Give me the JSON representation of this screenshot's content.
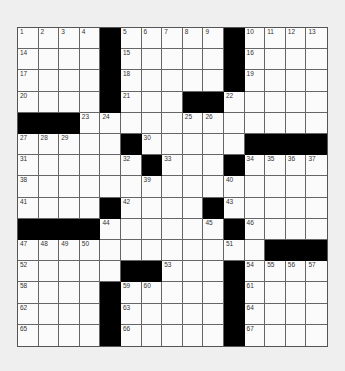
{
  "puzzle": {
    "rows": 15,
    "cols": 15,
    "colors": {
      "page_background": "#efefef",
      "cell_white": "#fbfbfb",
      "cell_black": "#000000",
      "grid_line": "#666666",
      "number_text": "#333333"
    },
    "grid": [
      ".....#.....#....",
      "x"
    ],
    "layout": [
      "1234#56789#ABCD",
      "....#.....#....",
      "....#.....#....",
      "....#...##.....",
      "###...........",
      "x"
    ],
    "black_cells": [
      [
        0,
        4
      ],
      [
        0,
        10
      ],
      [
        1,
        4
      ],
      [
        1,
        10
      ],
      [
        2,
        4
      ],
      [
        2,
        10
      ],
      [
        3,
        4
      ],
      [
        3,
        8
      ],
      [
        3,
        9
      ],
      [
        4,
        0
      ],
      [
        4,
        1
      ],
      [
        4,
        2
      ],
      [
        5,
        5
      ],
      [
        5,
        11
      ],
      [
        5,
        12
      ],
      [
        5,
        13
      ],
      [
        5,
        14
      ],
      [
        6,
        6
      ],
      [
        6,
        10
      ],
      [
        8,
        4
      ],
      [
        8,
        9
      ],
      [
        9,
        0
      ],
      [
        9,
        1
      ],
      [
        9,
        2
      ],
      [
        9,
        3
      ],
      [
        9,
        10
      ],
      [
        10,
        12
      ],
      [
        10,
        13
      ],
      [
        10,
        14
      ],
      [
        11,
        5
      ],
      [
        11,
        6
      ],
      [
        11,
        10
      ],
      [
        12,
        4
      ],
      [
        12,
        10
      ],
      [
        13,
        4
      ],
      [
        13,
        10
      ],
      [
        14,
        4
      ],
      [
        14,
        10
      ]
    ],
    "numbers": [
      {
        "r": 0,
        "c": 0,
        "n": "1"
      },
      {
        "r": 0,
        "c": 1,
        "n": "2"
      },
      {
        "r": 0,
        "c": 2,
        "n": "3"
      },
      {
        "r": 0,
        "c": 3,
        "n": "4"
      },
      {
        "r": 0,
        "c": 5,
        "n": "5"
      },
      {
        "r": 0,
        "c": 6,
        "n": "6"
      },
      {
        "r": 0,
        "c": 7,
        "n": "7"
      },
      {
        "r": 0,
        "c": 8,
        "n": "8"
      },
      {
        "r": 0,
        "c": 9,
        "n": "9"
      },
      {
        "r": 0,
        "c": 11,
        "n": "10"
      },
      {
        "r": 0,
        "c": 12,
        "n": "11"
      },
      {
        "r": 0,
        "c": 13,
        "n": "12"
      },
      {
        "r": 0,
        "c": 14,
        "n": "13"
      },
      {
        "r": 1,
        "c": 0,
        "n": "14"
      },
      {
        "r": 1,
        "c": 5,
        "n": "15"
      },
      {
        "r": 1,
        "c": 11,
        "n": "16"
      },
      {
        "r": 2,
        "c": 0,
        "n": "17"
      },
      {
        "r": 2,
        "c": 5,
        "n": "18"
      },
      {
        "r": 2,
        "c": 11,
        "n": "19"
      },
      {
        "r": 3,
        "c": 0,
        "n": "20"
      },
      {
        "r": 3,
        "c": 5,
        "n": "21"
      },
      {
        "r": 3,
        "c": 10,
        "n": "22"
      },
      {
        "r": 4,
        "c": 3,
        "n": "23"
      },
      {
        "r": 4,
        "c": 4,
        "n": "24"
      },
      {
        "r": 4,
        "c": 8,
        "n": "25"
      },
      {
        "r": 4,
        "c": 9,
        "n": "26"
      },
      {
        "r": 5,
        "c": 0,
        "n": "27"
      },
      {
        "r": 5,
        "c": 1,
        "n": "28"
      },
      {
        "r": 5,
        "c": 2,
        "n": "29"
      },
      {
        "r": 5,
        "c": 6,
        "n": "30"
      },
      {
        "r": 6,
        "c": 0,
        "n": "31"
      },
      {
        "r": 6,
        "c": 5,
        "n": "32"
      },
      {
        "r": 6,
        "c": 7,
        "n": "33"
      },
      {
        "r": 6,
        "c": 11,
        "n": "34"
      },
      {
        "r": 6,
        "c": 12,
        "n": "35"
      },
      {
        "r": 6,
        "c": 13,
        "n": "36"
      },
      {
        "r": 6,
        "c": 14,
        "n": "37"
      },
      {
        "r": 7,
        "c": 0,
        "n": "38"
      },
      {
        "r": 7,
        "c": 6,
        "n": "39"
      },
      {
        "r": 7,
        "c": 10,
        "n": "40"
      },
      {
        "r": 8,
        "c": 0,
        "n": "41"
      },
      {
        "r": 8,
        "c": 5,
        "n": "42"
      },
      {
        "r": 8,
        "c": 10,
        "n": "43"
      },
      {
        "r": 9,
        "c": 4,
        "n": "44"
      },
      {
        "r": 9,
        "c": 9,
        "n": "45"
      },
      {
        "r": 9,
        "c": 11,
        "n": "46"
      },
      {
        "r": 10,
        "c": 0,
        "n": "47"
      },
      {
        "r": 10,
        "c": 1,
        "n": "48"
      },
      {
        "r": 10,
        "c": 2,
        "n": "49"
      },
      {
        "r": 10,
        "c": 3,
        "n": "50"
      },
      {
        "r": 10,
        "c": 10,
        "n": "51"
      },
      {
        "r": 11,
        "c": 0,
        "n": "52"
      },
      {
        "r": 11,
        "c": 7,
        "n": "53"
      },
      {
        "r": 11,
        "c": 11,
        "n": "54"
      },
      {
        "r": 11,
        "c": 12,
        "n": "55"
      },
      {
        "r": 11,
        "c": 13,
        "n": "56"
      },
      {
        "r": 11,
        "c": 14,
        "n": "57"
      },
      {
        "r": 12,
        "c": 0,
        "n": "58"
      },
      {
        "r": 12,
        "c": 5,
        "n": "59"
      },
      {
        "r": 12,
        "c": 6,
        "n": "60"
      },
      {
        "r": 12,
        "c": 11,
        "n": "61"
      },
      {
        "r": 13,
        "c": 0,
        "n": "62"
      },
      {
        "r": 13,
        "c": 5,
        "n": "63"
      },
      {
        "r": 13,
        "c": 11,
        "n": "64"
      },
      {
        "r": 14,
        "c": 0,
        "n": "65"
      },
      {
        "r": 14,
        "c": 5,
        "n": "66"
      },
      {
        "r": 14,
        "c": 11,
        "n": "67"
      }
    ]
  }
}
